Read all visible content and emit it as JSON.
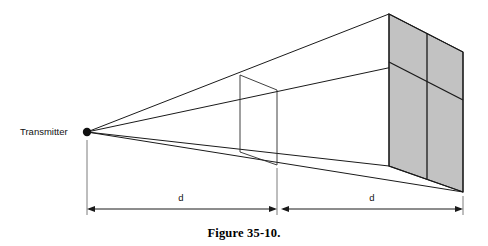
{
  "figure": {
    "caption": "Figure 35-10.",
    "transmitter_label": "Transmitter",
    "dimension_labels": {
      "near": "d",
      "far": "d"
    },
    "colors": {
      "panel_fill": "#c2c2c2",
      "line": "#1a1a1a",
      "extension_line": "#6e6e6e",
      "background": "#ffffff"
    },
    "geometry": {
      "apex": {
        "x": 87,
        "y": 132
      },
      "mid_plane": {
        "top_left": {
          "x": 240,
          "y": 75
        },
        "top_right": {
          "x": 277,
          "y": 90
        },
        "bottom_right": {
          "x": 277,
          "y": 165
        },
        "bottom_left": {
          "x": 240,
          "y": 152
        }
      },
      "far_panel": {
        "top_left": {
          "x": 389,
          "y": 14
        },
        "top_right": {
          "x": 463,
          "y": 52
        },
        "bottom_right": {
          "x": 463,
          "y": 192
        },
        "bottom_left": {
          "x": 389,
          "y": 166
        }
      },
      "far_panel_dividers": {
        "vertical_x": 427,
        "horizontal_left": {
          "x": 389,
          "y": 62
        },
        "horizontal_right": {
          "x": 463,
          "y": 100
        }
      },
      "dimension_axis_y": 209,
      "near_span": {
        "from": 87,
        "to": 277
      },
      "far_span": {
        "from": 281,
        "to": 463
      }
    }
  }
}
